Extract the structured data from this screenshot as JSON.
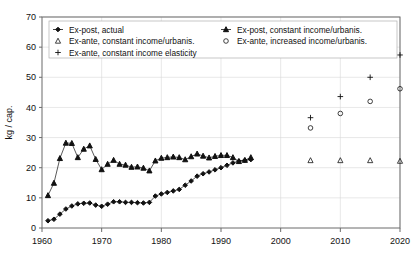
{
  "chart_data": {
    "type": "scatter",
    "title": "",
    "xlabel": "",
    "ylabel": "kg / cap.",
    "xlim": [
      1960,
      2020
    ],
    "ylim": [
      0,
      70
    ],
    "xticks": [
      1960,
      1970,
      1980,
      1990,
      2000,
      2010,
      2020
    ],
    "yticks": [
      0,
      10,
      20,
      30,
      40,
      50,
      60,
      70
    ],
    "grid": true,
    "legend_position": "top-inside",
    "series": [
      {
        "name": "Ex-post, actual",
        "marker": "filled-diamond",
        "line": true,
        "x": [
          1961,
          1962,
          1963,
          1964,
          1965,
          1966,
          1967,
          1968,
          1969,
          1970,
          1971,
          1972,
          1973,
          1974,
          1975,
          1976,
          1977,
          1978,
          1979,
          1980,
          1981,
          1982,
          1983,
          1984,
          1985,
          1986,
          1987,
          1988,
          1989,
          1990,
          1991,
          1992,
          1993,
          1994,
          1995
        ],
        "y": [
          2.4,
          2.9,
          4.6,
          6.3,
          7.3,
          8.0,
          8.2,
          8.3,
          7.6,
          7.2,
          7.9,
          8.7,
          8.7,
          8.5,
          8.5,
          8.4,
          8.3,
          8.5,
          10.6,
          11.3,
          11.8,
          12.3,
          12.8,
          14.2,
          15.6,
          17.2,
          18.0,
          18.6,
          19.3,
          20.0,
          20.8,
          21.6,
          22.2,
          22.5,
          22.7
        ]
      },
      {
        "name": "Ex-post, constant income/urbanis.",
        "marker": "filled-triangle",
        "line": true,
        "x": [
          1961,
          1962,
          1963,
          1964,
          1965,
          1966,
          1967,
          1968,
          1969,
          1970,
          1971,
          1972,
          1973,
          1974,
          1975,
          1976,
          1977,
          1978,
          1979,
          1980,
          1981,
          1982,
          1983,
          1984,
          1985,
          1986,
          1987,
          1988,
          1989,
          1990,
          1991,
          1992,
          1993,
          1994,
          1995
        ],
        "y": [
          10.8,
          14.9,
          23.1,
          28.2,
          28.1,
          23.4,
          26.2,
          27.3,
          22.8,
          19.4,
          21.2,
          22.5,
          21.2,
          20.9,
          20.2,
          20.3,
          19.9,
          19.0,
          22.3,
          23.2,
          23.4,
          23.6,
          23.4,
          22.7,
          23.7,
          24.6,
          23.9,
          23.3,
          23.8,
          24.1,
          24.1,
          23.4,
          22.1,
          22.5,
          23.4
        ]
      },
      {
        "name": "Ex-ante, constant income/urbanis.",
        "marker": "open-triangle",
        "line": false,
        "x": [
          2005,
          2010,
          2015,
          2020
        ],
        "y": [
          22.4,
          22.4,
          22.4,
          22.2
        ]
      },
      {
        "name": "Ex-ante, increased income/urbanis.",
        "marker": "open-circle",
        "line": false,
        "x": [
          2005,
          2010,
          2015,
          2020
        ],
        "y": [
          33.2,
          38.0,
          42.0,
          46.2
        ]
      },
      {
        "name": "Ex-ante, constant income elasticity",
        "marker": "plus",
        "line": false,
        "x": [
          2005,
          2010,
          2015,
          2020
        ],
        "y": [
          36.6,
          43.6,
          50.0,
          57.4
        ]
      }
    ]
  },
  "legend": {
    "entries": [
      {
        "label": "Ex-post, actual",
        "marker": "filled-diamond-line",
        "col": 0,
        "row": 0
      },
      {
        "label": "Ex-post, constant income/urbanis.",
        "marker": "filled-triangle-line",
        "col": 1,
        "row": 0
      },
      {
        "label": "Ex-ante, constant income/urbanis.",
        "marker": "open-triangle",
        "col": 0,
        "row": 1
      },
      {
        "label": "Ex-ante, increased income/urbanis.",
        "marker": "open-circle",
        "col": 1,
        "row": 1
      },
      {
        "label": "Ex-ante, constant income elasticity",
        "marker": "plus",
        "col": 0,
        "row": 2
      }
    ]
  },
  "axes": {
    "y_title": "kg / cap.",
    "y_tick_labels": [
      "0",
      "10",
      "20",
      "30",
      "40",
      "50",
      "60",
      "70"
    ],
    "x_tick_labels": [
      "1960",
      "1970",
      "1980",
      "1990",
      "2000",
      "2010",
      "2020"
    ]
  }
}
